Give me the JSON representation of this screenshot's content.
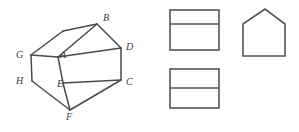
{
  "figure": {
    "stroke_color": "#4a4a4a",
    "net_stroke_color": "#555555",
    "background": "#ffffff",
    "labels": [
      {
        "text": "B",
        "x": 103,
        "y": 13
      },
      {
        "text": "D",
        "x": 126,
        "y": 42
      },
      {
        "text": "G",
        "x": 16,
        "y": 50
      },
      {
        "text": "A",
        "x": 60,
        "y": 50
      },
      {
        "text": "C",
        "x": 126,
        "y": 77
      },
      {
        "text": "H",
        "x": 16,
        "y": 76
      },
      {
        "text": "E",
        "x": 57,
        "y": 79
      },
      {
        "text": "F",
        "x": 66,
        "y": 112
      }
    ],
    "vertices": {
      "A": {
        "x": 58,
        "y": 57
      },
      "B": {
        "x": 97,
        "y": 24
      },
      "C": {
        "x": 121,
        "y": 80
      },
      "D": {
        "x": 121,
        "y": 48
      },
      "E": {
        "x": 63,
        "y": 83
      },
      "F": {
        "x": 70,
        "y": 110
      },
      "G": {
        "x": 31,
        "y": 55
      },
      "H": {
        "x": 32,
        "y": 81
      },
      "ridge_back": {
        "x": 63,
        "y": 31
      }
    },
    "solid_paths": {
      "roof_ridge_left": "M 31 55 L 63 31",
      "roof_top_back": "M 63 31 L 97 24",
      "roof_front_slope": "M 97 24 L 58 57",
      "roof_left_edge": "M 31 55 L 58 57",
      "gable_left_to_a": "M 31 55 L 58 57",
      "front_face": "M 58 57 L 63 83 L 121 80 L 121 48 Z",
      "right_wall_top": "M 97 24 L 121 48",
      "right_wall_side": "M 121 48 L 121 80",
      "left_wall": "M 31 55 L 32 81 L 63 83",
      "bottom_front": "M 32 81 L 70 110 L 121 80",
      "e_to_f": "M 63 83 L 70 110"
    },
    "nets": {
      "rect_top": {
        "x": 170,
        "y": 10,
        "w": 49,
        "h": 40,
        "fold_y": 20
      },
      "rect_bottom": {
        "x": 170,
        "y": 69,
        "w": 49,
        "h": 39,
        "fold_y": 88
      },
      "pentagon": {
        "x": 243,
        "y": 8,
        "w": 42,
        "h": 48,
        "apex_x": 265,
        "shoulder_y": 24
      }
    }
  }
}
